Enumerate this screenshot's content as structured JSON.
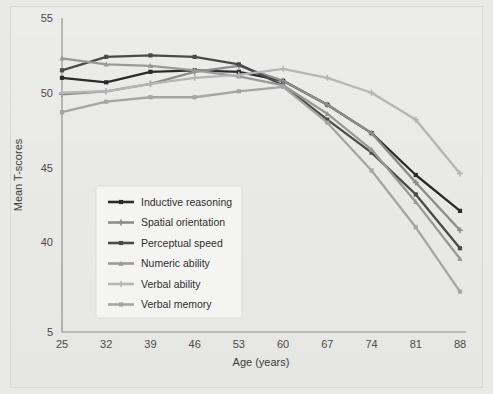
{
  "figure": {
    "background_color": "#e9e9e6",
    "panel_color": "#ebebe9"
  },
  "chart_data": {
    "type": "line",
    "title": "",
    "subtitle": "",
    "xlabel": "Age (years)",
    "ylabel": "Mean T-scores",
    "x": [
      25,
      32,
      39,
      46,
      53,
      60,
      67,
      74,
      81,
      88
    ],
    "categories": [
      "25",
      "32",
      "39",
      "46",
      "53",
      "60",
      "67",
      "74",
      "81",
      "88"
    ],
    "xtick_labels": [
      "25",
      "32",
      "39",
      "46",
      "53",
      "60",
      "67",
      "74",
      "81",
      "88"
    ],
    "ytick_labels": [
      "5",
      "40",
      "45",
      "50",
      "55"
    ],
    "ytick_values": [
      35,
      40,
      45,
      50,
      55
    ],
    "ylim": [
      34,
      55
    ],
    "xlim": [
      25,
      88
    ],
    "grid": false,
    "legend_position": "center-left",
    "series": [
      {
        "name": "Inductive reasoning",
        "color": "#2b2b2b",
        "marker": "square",
        "values": [
          51.0,
          50.7,
          51.4,
          51.5,
          51.4,
          50.8,
          49.2,
          47.3,
          44.5,
          42.1
        ]
      },
      {
        "name": "Spatial orientation",
        "color": "#8c8c8c",
        "marker": "plus",
        "values": [
          49.9,
          50.1,
          50.6,
          51.4,
          51.8,
          50.8,
          49.2,
          47.3,
          44.0,
          40.8
        ]
      },
      {
        "name": "Perceptual speed",
        "color": "#4a4a4a",
        "marker": "square",
        "values": [
          51.5,
          52.4,
          52.5,
          52.4,
          51.9,
          50.5,
          48.2,
          46.0,
          43.2,
          39.6
        ]
      },
      {
        "name": "Numeric ability",
        "color": "#999999",
        "marker": "triangle",
        "values": [
          52.3,
          51.9,
          51.8,
          51.5,
          51.1,
          50.5,
          48.6,
          46.2,
          42.7,
          38.9
        ]
      },
      {
        "name": "Verbal ability",
        "color": "#b5b5b5",
        "marker": "plus",
        "values": [
          50.0,
          50.1,
          50.6,
          51.0,
          51.2,
          51.6,
          51.0,
          50.0,
          48.2,
          44.6
        ]
      },
      {
        "name": "Verbal memory",
        "color": "#a5a5a5",
        "marker": "square",
        "values": [
          48.7,
          49.4,
          49.7,
          49.7,
          50.1,
          50.4,
          48.0,
          44.8,
          41.0,
          36.7
        ]
      }
    ]
  },
  "legend": {
    "items": [
      {
        "label": "Inductive reasoning"
      },
      {
        "label": "Spatial orientation"
      },
      {
        "label": "Perceptual speed"
      },
      {
        "label": "Numeric ability"
      },
      {
        "label": "Verbal ability"
      },
      {
        "label": "Verbal memory"
      }
    ]
  }
}
